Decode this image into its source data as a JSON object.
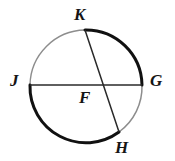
{
  "figure": {
    "kind": "circle-geometry-diagram",
    "background_color": "#ffffff",
    "stroke_dark": "#111111",
    "stroke_light": "#8d8d8d",
    "stroke_chord": "#2a2a2a",
    "labels": {
      "center": "F",
      "left": "J",
      "right": "G",
      "top": "K",
      "bottom": "H"
    },
    "geometry": {
      "center_x": 86,
      "center_y": 85,
      "radius": 56,
      "diameter_jg": {
        "from": "J",
        "to": "G",
        "x1": 30,
        "y1": 85,
        "x2": 142,
        "y2": 85
      },
      "chord_kh": {
        "from": "K",
        "to": "H",
        "x1": 85,
        "y1": 30,
        "x2": 119,
        "y2": 132
      },
      "points": {
        "K": {
          "x": 85,
          "y": 30
        },
        "J": {
          "x": 30,
          "y": 85
        },
        "G": {
          "x": 142,
          "y": 85
        },
        "H": {
          "x": 119,
          "y": 132
        },
        "F": {
          "x": 86,
          "y": 85
        }
      },
      "arcs": [
        {
          "name": "arc-K-G",
          "from": "K",
          "to": "G",
          "shade": "dark",
          "width": 3.0
        },
        {
          "name": "arc-G-H",
          "from": "G",
          "to": "H",
          "shade": "light",
          "width": 1.4
        },
        {
          "name": "arc-H-J",
          "from": "H",
          "to": "J",
          "shade": "dark",
          "width": 3.0
        },
        {
          "name": "arc-J-K",
          "from": "J",
          "to": "K",
          "shade": "light",
          "width": 1.4
        }
      ]
    }
  }
}
